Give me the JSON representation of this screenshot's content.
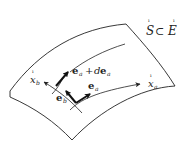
{
  "diagram": {
    "title_label": {
      "set": "S",
      "subset_symbol": "⊂",
      "space": "E",
      "accent_mark": "ı"
    },
    "surface": {
      "name": "curved surface patch",
      "stroke": "#222222"
    },
    "coordinate_curves": [
      {
        "id": "x_a",
        "label": "x",
        "subscript": "a",
        "accent_mark": "ı"
      },
      {
        "id": "x_b",
        "label": "x",
        "subscript": "b",
        "accent_mark": "ı"
      }
    ],
    "vectors": [
      {
        "id": "e_a",
        "label": "e",
        "subscript": "a"
      },
      {
        "id": "e_b",
        "label": "e",
        "subscript": "b"
      },
      {
        "id": "e_a_plus_de_a",
        "label": "e",
        "subscript": "a",
        "plus": "+",
        "d": "d",
        "label2": "e",
        "subscript2": "a"
      }
    ]
  }
}
